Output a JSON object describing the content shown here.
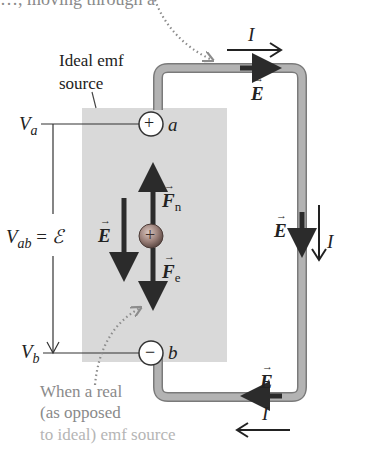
{
  "figure": {
    "top_caption_fragment": "…, moving through a",
    "source_label_line1": "Ideal emf",
    "source_label_line2": "source",
    "terminal_a": {
      "symbol": "+",
      "label": "a"
    },
    "terminal_b": {
      "symbol": "−",
      "label": "b"
    },
    "potential_a": {
      "base": "V",
      "sub": "a"
    },
    "potential_b": {
      "base": "V",
      "sub": "b"
    },
    "potential_difference": {
      "base": "V",
      "sub": "ab",
      "equals": "=",
      "emf_symbol": "ℰ"
    },
    "inside_field_label": "E",
    "force_nonelectric": {
      "base": "F",
      "sub": "n"
    },
    "force_electric": {
      "base": "F",
      "sub": "e"
    },
    "charge_symbol": "+",
    "wire_top": {
      "current_label": "I",
      "field_label": "E"
    },
    "wire_right": {
      "current_label": "I",
      "field_label": "E"
    },
    "wire_bottom": {
      "current_label": "I",
      "field_label": "E"
    },
    "bottom_caption_line1": "When a real",
    "bottom_caption_line2": "(as opposed",
    "bottom_caption_line3": "to ideal) emf source"
  },
  "colors": {
    "source_fill": "#d9d9d9",
    "wire_fill": "#a9a9a9",
    "wire_edge": "#7a7a7a",
    "arrow": "#2b2b2b",
    "dotted": "#8c8c8c",
    "charge_fill": "#9a7f78"
  }
}
